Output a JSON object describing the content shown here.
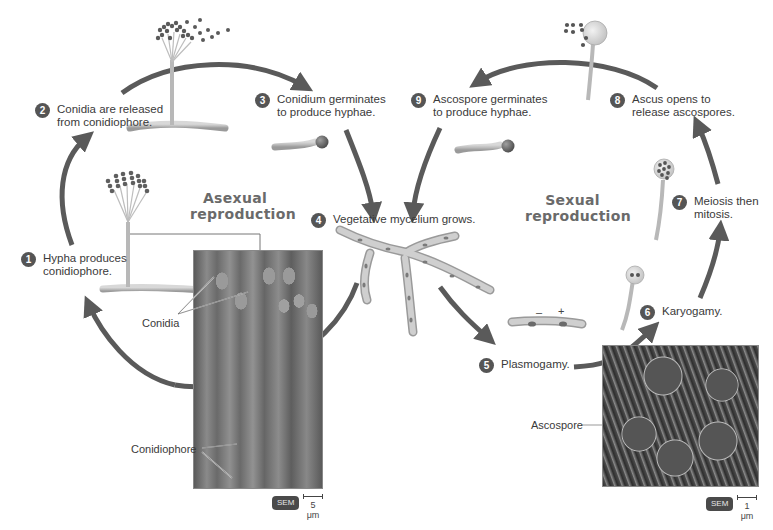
{
  "diagram": {
    "sections": {
      "asexual": "Asexual\nreproduction",
      "sexual": "Sexual\nreproduction"
    },
    "steps": [
      {
        "num": "1",
        "text": "Hypha produces\nconidiophore."
      },
      {
        "num": "2",
        "text": "Conidia are released\nfrom conidiophore."
      },
      {
        "num": "3",
        "text": "Conidium germinates\nto produce hyphae."
      },
      {
        "num": "4",
        "text": "Vegetative mycelium grows."
      },
      {
        "num": "5",
        "text": "Plasmogamy."
      },
      {
        "num": "6",
        "text": "Karyogamy."
      },
      {
        "num": "7",
        "text": "Meiosis then\nmitosis."
      },
      {
        "num": "8",
        "text": "Ascus opens to\nrelease ascospores."
      },
      {
        "num": "9",
        "text": "Ascospore germinates\nto produce hyphae."
      }
    ],
    "labels": {
      "conidia": "Conidia",
      "conidiophore": "Conidiophore",
      "ascospore": "Ascospore",
      "minus": "–",
      "plus": "+"
    },
    "micrographs": [
      {
        "type": "SEM",
        "scale": "5 μm"
      },
      {
        "type": "SEM",
        "scale": "1 μm"
      }
    ],
    "colors": {
      "arrow": "#5a5a5a",
      "badge": "#555555",
      "hypha": "#b8b8b8",
      "spore": "#6a6a6a"
    }
  }
}
